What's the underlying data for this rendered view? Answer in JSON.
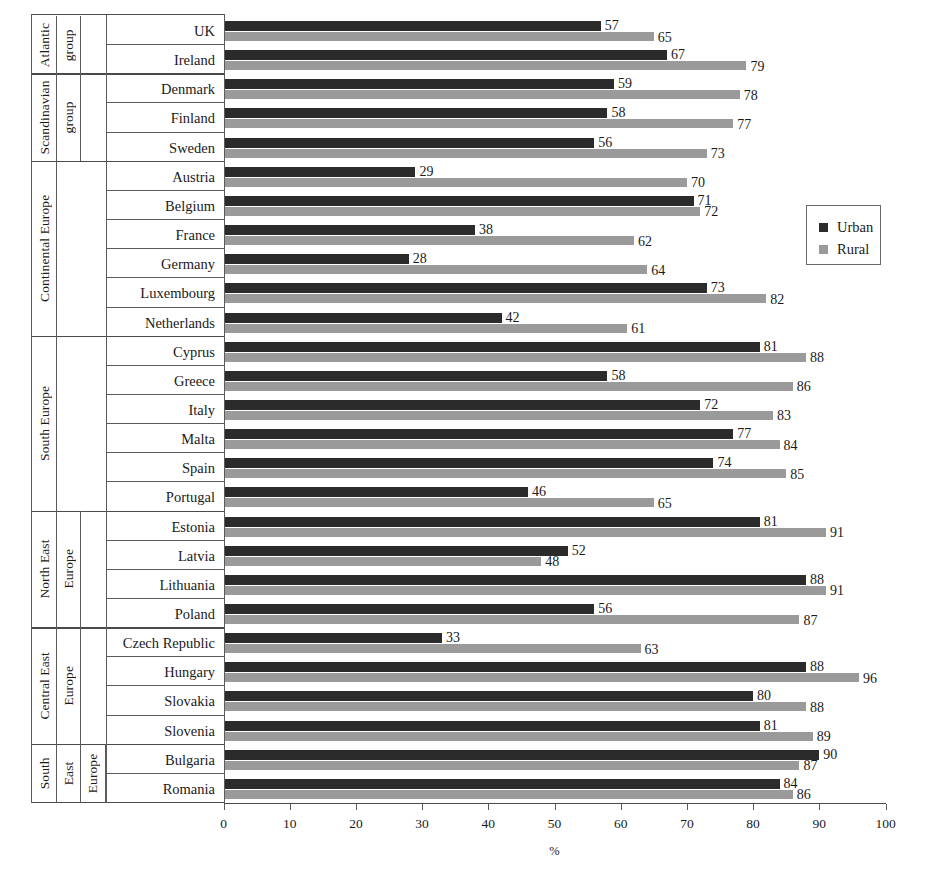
{
  "chart_data": {
    "type": "bar",
    "orientation": "horizontal",
    "title": "",
    "xlabel": "%",
    "ylabel": "",
    "xlim": [
      0,
      100
    ],
    "xticks": [
      "0",
      "10",
      "20",
      "30",
      "40",
      "50",
      "60",
      "70",
      "80",
      "90",
      "100"
    ],
    "grid": false,
    "legend_position": "right-top",
    "legend": [
      "Urban",
      "Rural"
    ],
    "series": [
      {
        "name": "Urban",
        "color": "#2b2b2b",
        "values": [
          57,
          67,
          59,
          58,
          56,
          29,
          71,
          38,
          28,
          73,
          42,
          81,
          58,
          72,
          77,
          74,
          46,
          81,
          52,
          88,
          56,
          33,
          88,
          80,
          81,
          90,
          84
        ]
      },
      {
        "name": "Rural",
        "color": "#9a9a9a",
        "values": [
          65,
          79,
          78,
          77,
          73,
          70,
          72,
          62,
          64,
          82,
          61,
          88,
          86,
          83,
          84,
          85,
          65,
          91,
          48,
          91,
          87,
          63,
          96,
          88,
          89,
          87,
          86
        ]
      }
    ],
    "categories": [
      "UK",
      "Ireland",
      "Denmark",
      "Finland",
      "Sweden",
      "Austria",
      "Belgium",
      "France",
      "Germany",
      "Luxembourg",
      "Netherlands",
      "Cyprus",
      "Greece",
      "Italy",
      "Malta",
      "Spain",
      "Portugal",
      "Estonia",
      "Latvia",
      "Lithuania",
      "Poland",
      "Czech Republic",
      "Hungary",
      "Slovakia",
      "Slovenia",
      "Bulgaria",
      "Romania"
    ],
    "groups": [
      {
        "labels": [
          "Atlantic",
          "group"
        ],
        "countries": [
          "UK",
          "Ireland"
        ]
      },
      {
        "labels": [
          "Scandinavian",
          "group"
        ],
        "countries": [
          "Denmark",
          "Finland",
          "Sweden"
        ]
      },
      {
        "labels": [
          "Continental Europe"
        ],
        "countries": [
          "Austria",
          "Belgium",
          "France",
          "Germany",
          "Luxembourg",
          "Netherlands"
        ]
      },
      {
        "labels": [
          "South Europe"
        ],
        "countries": [
          "Cyprus",
          "Greece",
          "Italy",
          "Malta",
          "Spain",
          "Portugal"
        ]
      },
      {
        "labels": [
          "North East",
          "Europe"
        ],
        "countries": [
          "Estonia",
          "Latvia",
          "Lithuania",
          "Poland"
        ]
      },
      {
        "labels": [
          "Central East",
          "Europe"
        ],
        "countries": [
          "Czech Republic",
          "Hungary",
          "Slovakia",
          "Slovenia"
        ]
      },
      {
        "labels": [
          "South",
          "East",
          "Europe"
        ],
        "countries": [
          "Bulgaria",
          "Romania"
        ]
      }
    ]
  },
  "colors": {
    "urban": "#2b2b2b",
    "rural": "#9a9a9a",
    "axis": "#5b5b5b",
    "background": "#ffffff"
  }
}
